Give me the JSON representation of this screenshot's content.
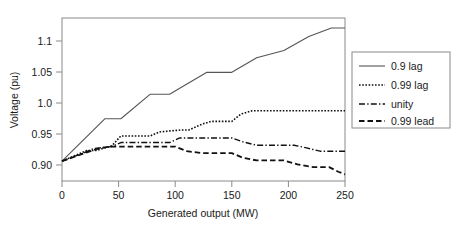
{
  "chart_data": {
    "type": "line",
    "title": "",
    "xlabel": "Generated output (MW)",
    "ylabel": "Voltage (pu)",
    "xlim": [
      0,
      250
    ],
    "ylim": [
      0.882,
      1.128
    ],
    "xticks": [
      0,
      50,
      100,
      150,
      200,
      250
    ],
    "xtick_labels": [
      "0",
      "50",
      "100",
      "150",
      "200",
      "250"
    ],
    "yticks": [
      0.9,
      0.95,
      1.0,
      1.05,
      1.1
    ],
    "ytick_labels": [
      "0.90",
      "0.95",
      "1.0",
      "1.05",
      "1.1"
    ],
    "grid": false,
    "legend_position": "right-outside",
    "series": [
      {
        "name": "0.9 lag",
        "style": "solid",
        "color": "#555555",
        "x": [
          0,
          18,
          38,
          38,
          52,
          52,
          78,
          78,
          103,
          103,
          128,
          128,
          150,
          150,
          172,
          172,
          196,
          196,
          218,
          218,
          238,
          238,
          250
        ],
        "y": [
          0.912,
          0.944,
          0.976,
          0.976,
          0.988,
          0.988,
          1.013,
          1.013,
          1.013,
          1.013,
          1.046,
          1.046,
          1.046,
          1.046,
          1.068,
          1.068,
          1.079,
          1.079,
          1.1,
          1.1,
          1.113,
          1.113,
          1.113
        ],
        "points": [
          [
            0,
            0.912
          ],
          [
            38,
            0.976
          ],
          [
            52,
            0.976
          ],
          [
            78,
            1.013
          ],
          [
            95,
            1.013
          ],
          [
            128,
            1.046
          ],
          [
            150,
            1.046
          ],
          [
            172,
            1.068
          ],
          [
            196,
            1.079
          ],
          [
            218,
            1.1
          ],
          [
            238,
            1.113
          ],
          [
            250,
            1.113
          ]
        ]
      },
      {
        "name": "0.99 lag",
        "style": "dotted",
        "color": "#111111",
        "points": [
          [
            0,
            0.912
          ],
          [
            22,
            0.928
          ],
          [
            30,
            0.928
          ],
          [
            44,
            0.935
          ],
          [
            52,
            0.95
          ],
          [
            78,
            0.95
          ],
          [
            86,
            0.956
          ],
          [
            105,
            0.959
          ],
          [
            112,
            0.959
          ],
          [
            124,
            0.968
          ],
          [
            132,
            0.972
          ],
          [
            150,
            0.972
          ],
          [
            158,
            0.983
          ],
          [
            168,
            0.988
          ],
          [
            250,
            0.988
          ]
        ]
      },
      {
        "name": "unity",
        "style": "dashdot",
        "color": "#111111",
        "points": [
          [
            0,
            0.912
          ],
          [
            20,
            0.925
          ],
          [
            28,
            0.931
          ],
          [
            44,
            0.934
          ],
          [
            52,
            0.94
          ],
          [
            95,
            0.94
          ],
          [
            104,
            0.947
          ],
          [
            150,
            0.947
          ],
          [
            160,
            0.941
          ],
          [
            172,
            0.936
          ],
          [
            205,
            0.936
          ],
          [
            216,
            0.932
          ],
          [
            228,
            0.927
          ],
          [
            250,
            0.927
          ]
        ]
      },
      {
        "name": "0.99 lead",
        "style": "dashed",
        "color": "#111111",
        "points": [
          [
            0,
            0.912
          ],
          [
            20,
            0.924
          ],
          [
            30,
            0.93
          ],
          [
            42,
            0.934
          ],
          [
            52,
            0.934
          ],
          [
            64,
            0.934
          ],
          [
            78,
            0.934
          ],
          [
            100,
            0.934
          ],
          [
            110,
            0.927
          ],
          [
            124,
            0.924
          ],
          [
            150,
            0.924
          ],
          [
            160,
            0.917
          ],
          [
            172,
            0.913
          ],
          [
            196,
            0.913
          ],
          [
            208,
            0.907
          ],
          [
            222,
            0.903
          ],
          [
            236,
            0.903
          ],
          [
            244,
            0.896
          ],
          [
            250,
            0.892
          ]
        ]
      }
    ]
  },
  "legend": {
    "items": [
      {
        "label": "0.9 lag",
        "style": "solid"
      },
      {
        "label": "0.99 lag",
        "style": "dotted"
      },
      {
        "label": "unity",
        "style": "dashdot"
      },
      {
        "label": "0.99 lead",
        "style": "dashed"
      }
    ]
  }
}
